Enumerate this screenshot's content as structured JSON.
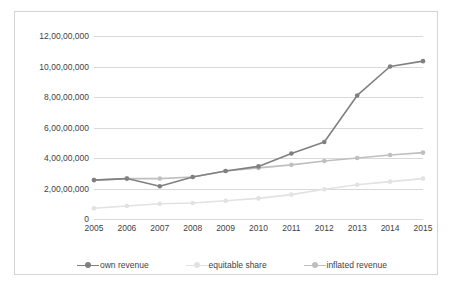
{
  "chart_data": {
    "type": "line",
    "title": "",
    "xlabel": "",
    "ylabel": "",
    "categories": [
      "2005",
      "2006",
      "2007",
      "2008",
      "2009",
      "2010",
      "2011",
      "2012",
      "2013",
      "2014",
      "2015"
    ],
    "ylim": [
      0,
      120000000
    ],
    "ytick_values": [
      0,
      20000000,
      40000000,
      60000000,
      80000000,
      100000000,
      120000000
    ],
    "ytick_labels": [
      "0",
      "2,00,00,000",
      "4,00,00,000",
      "6,00,00,000",
      "8,00,00,000",
      "10,00,00,000",
      "12,00,00,000"
    ],
    "grid": true,
    "legend_position": "bottom",
    "series": [
      {
        "name": "own revenue",
        "color": "#808080",
        "marker": "circle",
        "values": [
          25500000,
          26500000,
          21500000,
          27500000,
          31500000,
          34500000,
          43000000,
          50500000,
          81000000,
          100000000,
          103500000
        ]
      },
      {
        "name": "equitable share",
        "color": "#e2e2e2",
        "marker": "circle",
        "values": [
          7000000,
          8500000,
          10000000,
          10500000,
          12000000,
          13500000,
          16000000,
          19500000,
          22500000,
          24500000,
          26500000
        ]
      },
      {
        "name": "inflated revenue",
        "color": "#bfbfbf",
        "marker": "circle",
        "values": [
          25500000,
          26500000,
          26500000,
          27500000,
          31500000,
          33500000,
          35500000,
          38000000,
          40000000,
          42000000,
          43500000
        ]
      }
    ]
  },
  "legend": {
    "items": [
      {
        "label": "own revenue"
      },
      {
        "label": "equitable share"
      },
      {
        "label": "inflated revenue"
      }
    ]
  }
}
